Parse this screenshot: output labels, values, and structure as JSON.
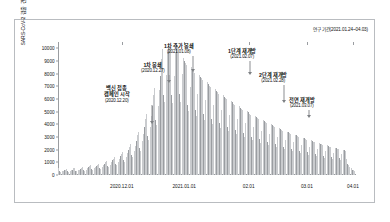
{
  "figure": {
    "period_note": "연구 기간(2021.01.24~04.03)",
    "ylabel": "SARS-CoV-2 검출 건수"
  },
  "chart_data": {
    "type": "bar",
    "title": "",
    "subtitle": "",
    "xlabel": "",
    "ylabel": "SARS-CoV-2 검출 건수",
    "grid": false,
    "legend": null,
    "ylim": [
      0,
      10500
    ],
    "yticks": [
      0,
      1000,
      2000,
      3000,
      4000,
      5000,
      6000,
      7000,
      8000,
      9000,
      10000
    ],
    "ytick_labels": [
      "0",
      "1000",
      "2000",
      "3000",
      "4000",
      "5000",
      "6000",
      "7000",
      "8000",
      "9000",
      "10000"
    ],
    "xticks": [
      "2020.12.01",
      "2021.01.01",
      "02.01",
      "03.01",
      "04.01"
    ],
    "xtick_positions": [
      0.215,
      0.425,
      0.642,
      0.838,
      0.993
    ],
    "bar_color_light": "#c9cbce",
    "bar_color_dark": "#9a9da1",
    "values": [
      520,
      300,
      240,
      280,
      330,
      360,
      420,
      470,
      300,
      260,
      330,
      380,
      430,
      520,
      560,
      340,
      300,
      380,
      430,
      470,
      560,
      620,
      380,
      330,
      430,
      520,
      600,
      700,
      760,
      470,
      410,
      540,
      640,
      720,
      820,
      900,
      560,
      500,
      660,
      790,
      900,
      1010,
      1100,
      690,
      620,
      830,
      1000,
      1150,
      1300,
      1400,
      880,
      790,
      1060,
      1280,
      1470,
      1680,
      1820,
      1150,
      1030,
      1400,
      1700,
      1960,
      2250,
      2450,
      1550,
      1390,
      1900,
      2320,
      2700,
      3120,
      3400,
      2150,
      1930,
      2650,
      3250,
      3800,
      4420,
      4800,
      3050,
      2750,
      3780,
      4640,
      5430,
      6330,
      6900,
      4380,
      3960,
      5450,
      6700,
      7840,
      9150,
      9980,
      6340,
      5730,
      7890,
      9700,
      10200,
      10050,
      9850,
      6280,
      5670,
      7810,
      9600,
      10400,
      10230,
      10060,
      6420,
      5800,
      7990,
      9200,
      9030,
      8870,
      8700,
      5560,
      5030,
      6930,
      8520,
      8370,
      8220,
      8070,
      5160,
      4660,
      6420,
      7900,
      7760,
      7620,
      7480,
      4780,
      4320,
      5950,
      7320,
      7190,
      7060,
      6930,
      4430,
      4010,
      5520,
      6790,
      6670,
      6550,
      6430,
      4110,
      3720,
      5120,
      6300,
      6190,
      6080,
      5970,
      3820,
      3450,
      4750,
      5840,
      5740,
      5640,
      5540,
      3540,
      3200,
      4410,
      5420,
      5320,
      5230,
      5140,
      3280,
      2970,
      4090,
      5030,
      4940,
      4850,
      4760,
      3040,
      2750,
      3790,
      4660,
      4580,
      4490,
      4410,
      2820,
      2550,
      3510,
      4320,
      4240,
      4170,
      4090,
      2610,
      2360,
      3250,
      4000,
      3930,
      3860,
      3790,
      2420,
      2190,
      3010,
      3710,
      3640,
      3580,
      3510,
      2240,
      2030,
      2790,
      3430,
      3370,
      3310,
      3250,
      2080,
      1880,
      2590,
      3180,
      3130,
      3070,
      3010,
      1920,
      1740,
      2400,
      2950,
      2900,
      2850,
      2790,
      1780,
      1610,
      2220,
      2730,
      2680,
      2630,
      2580,
      1650,
      1490,
      2050,
      2520,
      2480,
      2430,
      2390,
      1530,
      1380,
      1900,
      2340,
      2300,
      2250,
      2210,
      1410,
      1280,
      1760,
      2170,
      2130,
      2090,
      2050,
      1310,
      1180,
      1630,
      2000,
      1970,
      1930,
      1260,
      900,
      760,
      620,
      520,
      430,
      360,
      300
    ],
    "annotations": [
      {
        "label": "백신 접종\n캠페인 시작",
        "title_line1": "백신 접종",
        "title_line2": "캠페인 시작",
        "date": "(2020.12.20)",
        "marker_x_frac": 0.318,
        "marker_value": 4000
      },
      {
        "label": "1차 봉쇄",
        "title_line1": "1차 봉쇄",
        "title_line2": "",
        "date": "(2020.12.27)",
        "marker_x_frac": 0.375,
        "marker_value": 7300
      },
      {
        "label": "1차 추가 봉쇄",
        "title_line1": "1차 추가 봉쇄",
        "title_line2": "",
        "date": "(2021.01.08)",
        "marker_x_frac": 0.455,
        "marker_value": 8100
      },
      {
        "label": "1단계 재개방",
        "title_line1": "1단계 재개방",
        "title_line2": "",
        "date": "(2021.02.07)",
        "marker_x_frac": 0.648,
        "marker_value": 7900
      },
      {
        "label": "2단계 재개방",
        "title_line1": "2단계 재개방",
        "title_line2": "",
        "date": "(2021.02.28)",
        "marker_x_frac": 0.76,
        "marker_value": 5700
      },
      {
        "label": "전면 재개방",
        "title_line1": "전면 재개방",
        "title_line2": "",
        "date": "(2021.03.07)",
        "marker_x_frac": 0.845,
        "marker_value": 4500
      }
    ]
  }
}
